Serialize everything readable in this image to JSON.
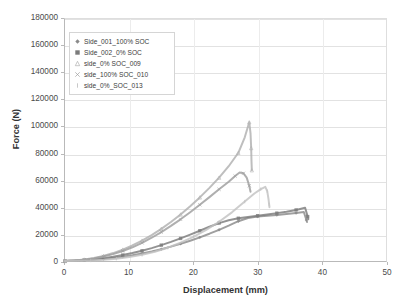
{
  "chart_data": {
    "type": "line",
    "title": "",
    "xlabel": "Displacement (mm)",
    "ylabel": "Force (N)",
    "xlim": [
      0,
      50
    ],
    "ylim": [
      0,
      180000
    ],
    "xticks": [
      "0",
      "10",
      "20",
      "30",
      "40",
      "50"
    ],
    "yticks": [
      "0",
      "20000",
      "40000",
      "60000",
      "80000",
      "100000",
      "120000",
      "140000",
      "160000",
      "180000"
    ],
    "grid": true,
    "legend_position": "top-left-inside",
    "series": [
      {
        "name": "Side_001_100% SOC",
        "marker": "diamond",
        "color": "#8a8a8a",
        "points": [
          [
            0,
            0
          ],
          [
            1.5,
            200
          ],
          [
            3,
            500
          ],
          [
            4.5,
            900
          ],
          [
            6,
            1500
          ],
          [
            7.5,
            2300
          ],
          [
            9,
            3200
          ],
          [
            10.5,
            4300
          ],
          [
            12,
            5600
          ],
          [
            13.5,
            7100
          ],
          [
            15,
            8800
          ],
          [
            16.5,
            10700
          ],
          [
            18,
            12800
          ],
          [
            19.5,
            15100
          ],
          [
            21,
            17600
          ],
          [
            22.5,
            20300
          ],
          [
            24,
            23200
          ],
          [
            25.5,
            26300
          ],
          [
            27,
            29600
          ],
          [
            28.5,
            32000
          ],
          [
            30,
            33000
          ],
          [
            31.5,
            33600
          ],
          [
            33,
            34200
          ],
          [
            34.5,
            34900
          ],
          [
            36,
            35700
          ],
          [
            37.2,
            36400
          ],
          [
            37.6,
            30500
          ],
          [
            37.7,
            29000
          ]
        ]
      },
      {
        "name": "Side_002_0% SOC",
        "marker": "square",
        "color": "#7b7b7b",
        "points": [
          [
            0,
            0
          ],
          [
            1.5,
            300
          ],
          [
            3,
            700
          ],
          [
            4.5,
            1300
          ],
          [
            6,
            2100
          ],
          [
            7.5,
            3100
          ],
          [
            9,
            4400
          ],
          [
            10.5,
            5900
          ],
          [
            12,
            7600
          ],
          [
            13.5,
            9600
          ],
          [
            15,
            11800
          ],
          [
            16.5,
            14200
          ],
          [
            18,
            16800
          ],
          [
            19.5,
            19600
          ],
          [
            21,
            22500
          ],
          [
            22.5,
            25500
          ],
          [
            24,
            28200
          ],
          [
            25.5,
            30300
          ],
          [
            27,
            31800
          ],
          [
            28.5,
            32800
          ],
          [
            30,
            33700
          ],
          [
            31.5,
            34600
          ],
          [
            33,
            35600
          ],
          [
            34.5,
            36700
          ],
          [
            36,
            38000
          ],
          [
            37.4,
            39600
          ],
          [
            37.8,
            33000
          ],
          [
            37.9,
            31000
          ]
        ]
      },
      {
        "name": "side_0% SOC_009",
        "marker": "triangle",
        "color": "#b0b0b0",
        "points": [
          [
            0,
            0
          ],
          [
            1.5,
            400
          ],
          [
            3,
            1100
          ],
          [
            4.5,
            2200
          ],
          [
            6,
            3800
          ],
          [
            7.5,
            5900
          ],
          [
            9,
            8500
          ],
          [
            10.5,
            11600
          ],
          [
            12,
            15200
          ],
          [
            13.5,
            19300
          ],
          [
            15,
            23900
          ],
          [
            16.5,
            29000
          ],
          [
            18,
            34600
          ],
          [
            19.5,
            40700
          ],
          [
            21,
            47300
          ],
          [
            22.5,
            54400
          ],
          [
            24,
            62000
          ],
          [
            25.5,
            70500
          ],
          [
            27,
            80500
          ],
          [
            28.0,
            92000
          ],
          [
            28.7,
            103200
          ],
          [
            28.9,
            95000
          ],
          [
            29.0,
            84000
          ],
          [
            29.05,
            74000
          ],
          [
            29.1,
            67500
          ]
        ]
      },
      {
        "name": "side_100% SOC_010",
        "marker": "cross",
        "color": "#9e9e9e",
        "points": [
          [
            0,
            0
          ],
          [
            1.5,
            350
          ],
          [
            3,
            950
          ],
          [
            4.5,
            1900
          ],
          [
            6,
            3300
          ],
          [
            7.5,
            5100
          ],
          [
            9,
            7400
          ],
          [
            10.5,
            10200
          ],
          [
            12,
            13500
          ],
          [
            13.5,
            17300
          ],
          [
            15,
            21500
          ],
          [
            16.5,
            26100
          ],
          [
            18,
            31000
          ],
          [
            19.5,
            36300
          ],
          [
            21,
            41800
          ],
          [
            22.5,
            47500
          ],
          [
            24,
            53300
          ],
          [
            25.5,
            58900
          ],
          [
            26.5,
            63200
          ],
          [
            27.2,
            65800
          ],
          [
            27.8,
            65200
          ],
          [
            28.3,
            62000
          ],
          [
            28.7,
            56000
          ],
          [
            28.9,
            51500
          ]
        ]
      },
      {
        "name": "side_0%_SOC_013",
        "marker": "bar",
        "color": "#c2c2c2",
        "points": [
          [
            0,
            0
          ],
          [
            2,
            150
          ],
          [
            4,
            400
          ],
          [
            6,
            900
          ],
          [
            8,
            1700
          ],
          [
            10,
            2900
          ],
          [
            12,
            4600
          ],
          [
            14,
            6900
          ],
          [
            16,
            9900
          ],
          [
            18,
            13600
          ],
          [
            20,
            18000
          ],
          [
            22,
            23200
          ],
          [
            24,
            29200
          ],
          [
            26,
            36200
          ],
          [
            28,
            44200
          ],
          [
            29.5,
            50200
          ],
          [
            30.5,
            53500
          ],
          [
            31.2,
            55200
          ],
          [
            31.5,
            52000
          ],
          [
            31.7,
            46000
          ],
          [
            31.8,
            42000
          ],
          [
            31.85,
            40000
          ]
        ]
      }
    ]
  },
  "legend": {
    "items": [
      {
        "label": "Side_001_100% SOC",
        "marker": "diamond"
      },
      {
        "label": "Side_002_0% SOC",
        "marker": "square"
      },
      {
        "label": "side_0% SOC_009",
        "marker": "triangle"
      },
      {
        "label": "side_100% SOC_010",
        "marker": "cross"
      },
      {
        "label": "side_0%_SOC_013",
        "marker": "bar"
      }
    ]
  }
}
